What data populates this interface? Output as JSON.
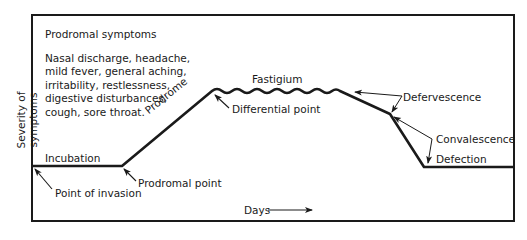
{
  "diagram": {
    "y_axis_label": "Severity of symptoms",
    "x_axis_label": "Days",
    "prodromal_box": {
      "title": "Prodromal symptoms",
      "lines": [
        "Nasal discharge, headache,",
        "mild fever, general aching,",
        "irritability, restlessness,",
        "digestive disturbances,",
        "cough, sore throat."
      ]
    },
    "stages": {
      "incubation": "Incubation",
      "prodrome": "Prodrome",
      "fastigium": "Fastigium",
      "defervescence": "Defervescence",
      "convalescence": "Convalescence",
      "defection": "Defection"
    },
    "points": {
      "invasion": "Point of invasion",
      "prodromal": "Prodromal point",
      "differential": "Differential point"
    },
    "colors": {
      "line": "#1a1a1a",
      "background": "#ffffff"
    }
  }
}
